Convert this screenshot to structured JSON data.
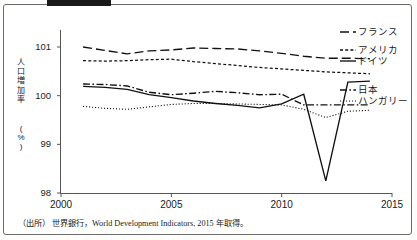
{
  "figure": {
    "redaction_bar": "black-bar",
    "frame_color": "#6b6b6b"
  },
  "axes": {
    "y_title_chars": [
      "人",
      "口",
      "増",
      "加",
      "率"
    ],
    "y_unit_chars": [
      "(",
      "%",
      ")"
    ],
    "y_ticks": [
      "101",
      "100",
      "99",
      "98"
    ],
    "y_tick_values": [
      101,
      100,
      99,
      98
    ],
    "x_ticks": [
      "2000",
      "2005",
      "2010",
      "2015"
    ],
    "x_tick_values": [
      2000,
      2005,
      2010,
      2015
    ]
  },
  "legend": [
    {
      "label": "フランス",
      "style": "long-dash",
      "x": 358,
      "y": 27
    },
    {
      "label": "アメリカ",
      "style": "short-dash",
      "x": 358,
      "y": 45
    },
    {
      "label": "ドイツ",
      "style": "solid",
      "x": 358,
      "y": 56
    },
    {
      "label": "日本",
      "style": "dash-dot",
      "x": 358,
      "y": 85
    },
    {
      "label": "ハンガリー",
      "style": "dotted",
      "x": 358,
      "y": 96
    }
  ],
  "source": {
    "prefix": "（出所）",
    "text": "世界銀行，World Development Indicators, 2015 年取得。"
  },
  "chart_data": {
    "type": "line",
    "title": "",
    "xlabel": "",
    "ylabel": "人口増加率（%）",
    "xlim": [
      2000,
      2015
    ],
    "ylim": [
      98,
      101.35
    ],
    "grid": false,
    "legend_position": "right",
    "x": [
      2001,
      2002,
      2003,
      2004,
      2005,
      2006,
      2007,
      2008,
      2009,
      2010,
      2011,
      2012,
      2013,
      2014
    ],
    "series": [
      {
        "name": "フランス",
        "style": "long-dash",
        "color": "#111111",
        "values": [
          101.0,
          100.93,
          100.86,
          100.92,
          100.94,
          100.98,
          100.97,
          100.96,
          100.92,
          100.87,
          100.81,
          100.77,
          100.77,
          100.76
        ]
      },
      {
        "name": "アメリカ",
        "style": "short-dash",
        "color": "#111111",
        "values": [
          100.72,
          100.71,
          100.72,
          100.74,
          100.75,
          100.7,
          100.66,
          100.62,
          100.58,
          100.55,
          100.52,
          100.49,
          100.47,
          100.45
        ]
      },
      {
        "name": "ドイツ",
        "style": "solid",
        "color": "#111111",
        "values": [
          100.19,
          100.17,
          100.13,
          100.02,
          99.96,
          99.89,
          99.84,
          99.8,
          99.75,
          99.83,
          100.03,
          98.25,
          100.28,
          100.3
        ]
      },
      {
        "name": "日本",
        "style": "dash-dot",
        "color": "#111111",
        "values": [
          100.24,
          100.23,
          100.2,
          100.07,
          100.02,
          100.05,
          100.09,
          100.06,
          100.02,
          100.03,
          99.81,
          99.81,
          99.81,
          99.81
        ]
      },
      {
        "name": "ハンガリー",
        "style": "dotted",
        "color": "#111111",
        "values": [
          99.78,
          99.74,
          99.72,
          99.77,
          99.82,
          99.84,
          99.84,
          99.83,
          99.82,
          99.81,
          99.72,
          99.55,
          99.68,
          99.7
        ]
      }
    ]
  }
}
